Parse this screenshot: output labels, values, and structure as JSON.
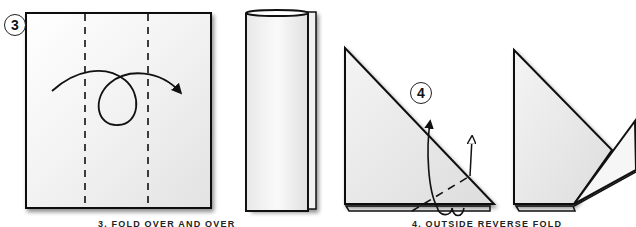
{
  "diagram": {
    "type": "origami-instructions",
    "steps": [
      {
        "number": "3",
        "caption": "3. FOLD OVER AND OVER",
        "figures": [
          "square-paper-with-two-dashed-fold-lines-and-loop-arrow",
          "rolled-tube-result"
        ]
      },
      {
        "number": "4",
        "caption": "4. OUTSIDE REVERSE FOLD",
        "figures": [
          "triangle-with-dashed-fold-line-and-reverse-fold-arrows",
          "triangle-with-reversed-flap-result"
        ]
      }
    ],
    "colors": {
      "line": "#1a1a1a",
      "paper_light": "#ffffff",
      "paper_shade": "#e6e6e6",
      "shadow": "#9a9a9a"
    }
  }
}
